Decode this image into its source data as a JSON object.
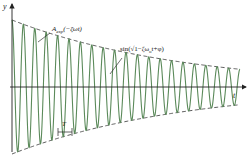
{
  "chart_data": {
    "type": "line",
    "title": "",
    "xlabel": "t",
    "ylabel": "y",
    "series": [
      {
        "name": "damped-oscillation",
        "color": "#5b8a5a",
        "style": "solid",
        "amplitude": 1.0,
        "decay_rate": 0.7,
        "cycles": 20
      },
      {
        "name": "upper-envelope",
        "color": "#333333",
        "style": "dashed"
      },
      {
        "name": "lower-envelope",
        "color": "#333333",
        "style": "dashed"
      }
    ],
    "annotations": {
      "envelope_label_main": "A",
      "envelope_label_sub": "exp",
      "envelope_label_rest": "(−ζωt)",
      "wave_label": "sin(√1−ζω",
      "wave_label_sub": "o",
      "wave_label_rest": "t+φ)",
      "period_label": "T"
    },
    "axes": {
      "x_label": "t",
      "y_label": "y"
    }
  }
}
